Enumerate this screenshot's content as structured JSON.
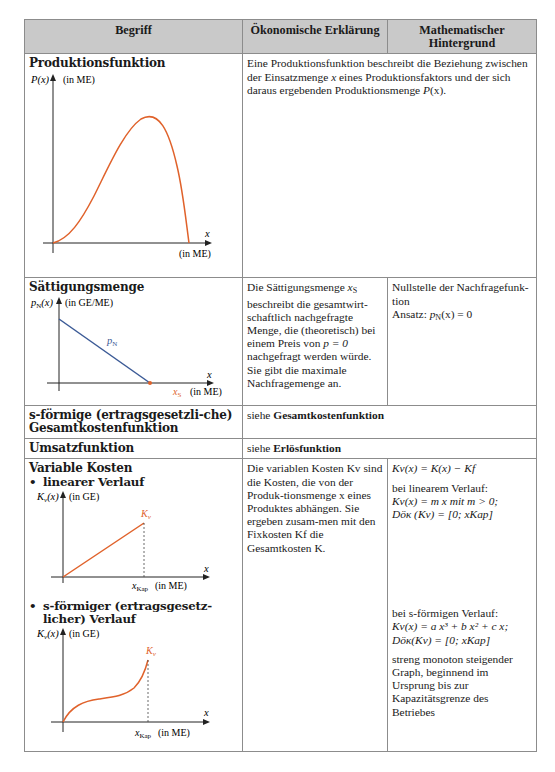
{
  "table": {
    "headers": [
      "Begriff",
      "Ökonomische Erklärung",
      "Mathematischer Hintergrund"
    ],
    "rows": {
      "produktionsfunktion": {
        "term": "Produktionsfunktion",
        "explanation_1": "Eine Produktionsfunktion beschreibt die Beziehung zwischen der Einsatzmenge ",
        "explanation_x": "x",
        "explanation_2": " eines Produktionsfaktors und der sich daraus ergebenden Produktionsmenge ",
        "explanation_p": "P",
        "explanation_3": "(x).",
        "graph": {
          "y_label": "P(x)",
          "y_unit": "(in ME)",
          "x_label": "x",
          "x_unit": "(in ME)",
          "curve_color": "#e0622b"
        }
      },
      "saettigungsmenge": {
        "term": "Sättigungsmenge",
        "explanation": [
          "Die Sättigungsmenge ",
          "x",
          "S",
          " beschreibt die gesamtwirt-schaftlich nachgefragte Menge, die (theoretisch) bei einem Preis von ",
          "p = 0",
          " nachgefragt werden würde. Sie gibt die maximale Nachfragemenge an."
        ],
        "math_line1": "Nullstelle der Nachfragefunk-tion",
        "math_line2_prefix": "Ansatz: ",
        "math_line2_formula": "p",
        "math_line2_sub": "N",
        "math_line2_rest": "(x) = 0",
        "graph": {
          "y_label": "p",
          "y_label_sub": "N",
          "y_label_arg": "(x)",
          "y_unit": "(in GE/ME)",
          "line_label": "p",
          "line_label_sub": "N",
          "x_label": "x",
          "x_marker": "x",
          "x_marker_sub": "S",
          "x_unit": "(in ME)",
          "line_color": "#3b5a96",
          "marker_color": "#e0622b"
        }
      },
      "s_gesamtkosten": {
        "term": "s-förmige (ertragsgesetzli-che) Gesamtkostenfunktion",
        "ref_prefix": "siehe ",
        "ref_bold": "Gesamtkostenfunktion"
      },
      "umsatzfunktion": {
        "term": "Umsatzfunktion",
        "ref_prefix": "siehe ",
        "ref_bold": "Erlösfunktion"
      },
      "variable_kosten": {
        "term": "Variable Kosten",
        "bullet_linear": "linearer Verlauf",
        "bullet_s": "s-förmiger (ertragsgesetz-licher) Verlauf",
        "explanation": "Die variablen Kosten Kv sind die Kosten, die von der Produk-tionsmenge x eines Produktes abhängen. Sie ergeben zusam-men mit den Fixkosten Kf die Gesamtkosten K.",
        "math_def": "Kv(x) = K(x) − Kf",
        "math_linear_title": "bei linearem Verlauf:",
        "math_linear_formula": "Kv(x) = m x  mit  m > 0;",
        "math_linear_domain": "Döк (Kv) = [0; xKap]",
        "math_s_title": "bei s-förmigen Verlauf:",
        "math_s_formula": "Kv(x) = a x³ + b x² + c x;",
        "math_s_domain": "Döк(Kv) = [0; xKap]",
        "math_s_note": "streng monoton steigender Graph, beginnend im Ursprung bis zur Kapazitätsgrenze des Betriebes",
        "graph_linear": {
          "y_label": "Kv(x)",
          "y_unit": "(in GE)",
          "curve_label": "Kv",
          "x_label": "x",
          "x_marker": "xKap",
          "x_unit": "(in ME)",
          "curve_color": "#e0622b"
        },
        "graph_s": {
          "y_label": "Kv(x)",
          "y_unit": "(in GE)",
          "curve_label": "Kv",
          "x_label": "x",
          "x_marker": "xKap",
          "x_unit": "(in ME)",
          "curve_color": "#e0622b"
        }
      }
    }
  },
  "colors": {
    "header_bg": "#c9c9c9",
    "border": "#8c8c8c",
    "accent_orange": "#e0622b",
    "accent_blue": "#3b5a96"
  }
}
